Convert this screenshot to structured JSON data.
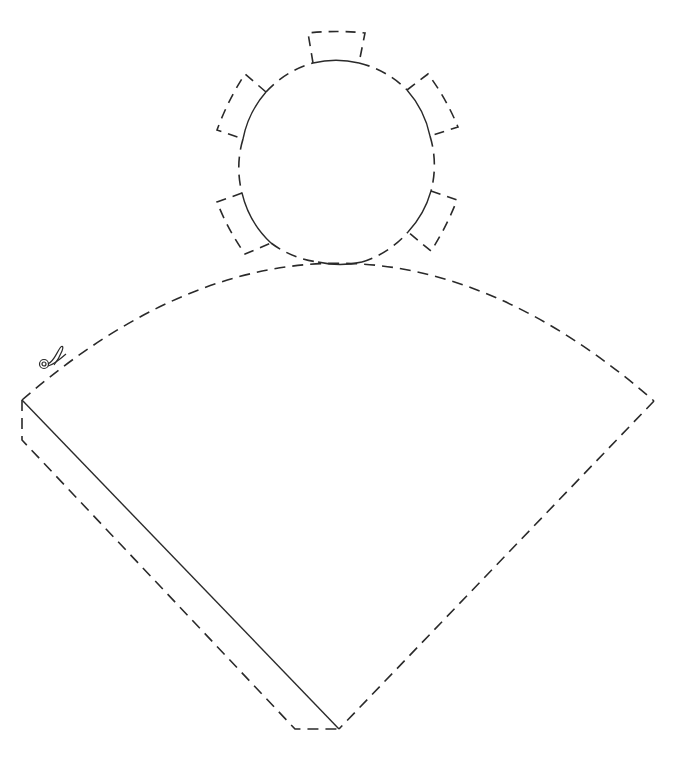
{
  "diagram": {
    "type": "paper-cone-template",
    "colors": {
      "line": "#2a2a2a",
      "background": "#ffffff"
    },
    "circle_base": {
      "center": [
        337,
        163
      ],
      "radius": 100,
      "tabs": [
        {
          "name": "top",
          "base": [
            [
              313,
              63
            ],
            [
              359,
              63
            ]
          ],
          "outer": [
            [
              308,
              33
            ],
            [
              365,
              33
            ]
          ]
        },
        {
          "name": "upper-left",
          "base": [
            [
              266,
              92
            ],
            [
              243,
              139
            ]
          ],
          "outer": [
            [
              245,
              74
            ],
            [
              217,
              130
            ]
          ]
        },
        {
          "name": "upper-right",
          "base": [
            [
              407,
              90
            ],
            [
              430,
              136
            ]
          ],
          "outer": [
            [
              428,
              74
            ],
            [
              458,
              127
            ]
          ]
        },
        {
          "name": "lower-left",
          "base": [
            [
              242,
              193
            ],
            [
              271,
              243
            ]
          ],
          "outer": [
            [
              217,
              202
            ],
            [
              245,
              254
            ]
          ]
        },
        {
          "name": "lower-right",
          "base": [
            [
              431,
              191
            ],
            [
              408,
              232
            ]
          ],
          "outer": [
            [
              457,
              200
            ],
            [
              431,
              251
            ]
          ]
        }
      ]
    },
    "cone_sector": {
      "apex": [
        339,
        729
      ],
      "left_corner": [
        22,
        400
      ],
      "right_corner": [
        654,
        401
      ],
      "arc_top": [
        339,
        263
      ],
      "glue_flap": [
        [
          22,
          400
        ],
        [
          22,
          440
        ],
        [
          295,
          729
        ],
        [
          339,
          729
        ]
      ]
    },
    "icons": [
      {
        "name": "scissors-icon",
        "position": [
          52,
          355
        ]
      }
    ]
  }
}
